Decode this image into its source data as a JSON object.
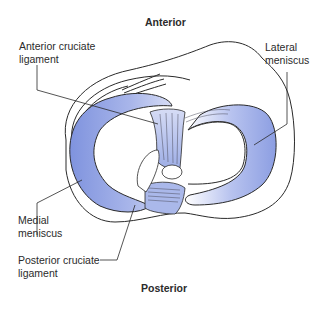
{
  "figure": {
    "orientation_top": "Anterior",
    "orientation_bottom": "Posterior",
    "labels": {
      "anterior_cruciate": {
        "line1": "Anterior cruciate",
        "line2": "ligament"
      },
      "lateral_meniscus": {
        "line1": "Lateral",
        "line2": "meniscus"
      },
      "medial_meniscus": {
        "line1": "Medial",
        "line2": "meniscus"
      },
      "posterior_cruciate": {
        "line1": "Posterior cruciate",
        "line2": "ligament"
      }
    },
    "colors": {
      "meniscus_fill": "#8c9ee0",
      "ligament_fill": "#b8c4ec",
      "outline": "#2a2a2a",
      "background": "#ffffff"
    }
  }
}
